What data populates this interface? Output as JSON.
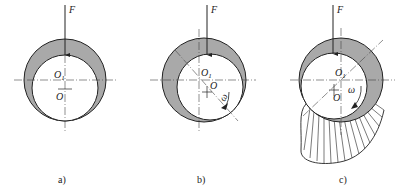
{
  "figure": {
    "panels": [
      {
        "id": "a",
        "caption": "a)",
        "force_label": "F",
        "bearing_center_label": "O",
        "journal_center_label": "O",
        "journal_center_sub": "1",
        "state": "at rest"
      },
      {
        "id": "b",
        "caption": "b)",
        "force_label": "F",
        "bearing_center_label": "O",
        "journal_center_label": "O",
        "journal_center_sub": "1",
        "rotation_label": "ω",
        "state": "starting rotation"
      },
      {
        "id": "c",
        "caption": "c)",
        "force_label": "F",
        "bearing_center_label": "O",
        "journal_center_label": "O",
        "journal_center_sub": "1",
        "rotation_label": "ω",
        "state": "stable hydrodynamic lubrication with oil pressure distribution"
      }
    ],
    "colors": {
      "oil_film": "#a9a9a9",
      "line": "#222222",
      "background": "#ffffff"
    }
  }
}
